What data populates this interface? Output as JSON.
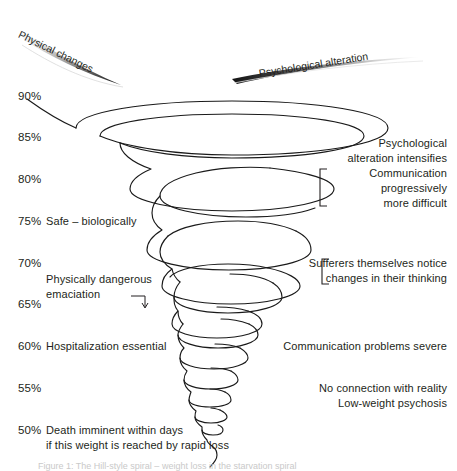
{
  "figure": {
    "wedges": [
      {
        "id": "physical-changes",
        "label": "Physical changes"
      },
      {
        "id": "psychological-alteration",
        "label": "Psychological alteration"
      }
    ],
    "axis": {
      "unit": "%",
      "ticks": [
        "90%",
        "85%",
        "80%",
        "75%",
        "70%",
        "65%",
        "60%",
        "55%",
        "50%"
      ]
    },
    "left_annotations": [
      {
        "tick": "75%",
        "lines": [
          "Safe – biologically"
        ]
      },
      {
        "tick": "70%",
        "lines": [
          "Physically dangerous",
          "emaciation"
        ]
      },
      {
        "tick": "60%",
        "lines": [
          "Hospitalization essential"
        ]
      },
      {
        "tick": "50%",
        "lines": [
          "Death imminent within days",
          "if this weight is reached by rapid loss"
        ]
      }
    ],
    "right_annotations": [
      {
        "id": "psych-intensifies",
        "bracket": false,
        "lines": [
          "Psychological",
          "alteration intensifies"
        ]
      },
      {
        "id": "communication-difficult",
        "bracket": true,
        "lines": [
          "Communication",
          "progressively",
          "more difficult"
        ]
      },
      {
        "id": "sufferers-notice",
        "bracket": true,
        "lines": [
          "Sufferers themselves notice",
          "changes in their thinking"
        ]
      },
      {
        "id": "communication-severe",
        "bracket": false,
        "lines": [
          "Communication problems severe"
        ]
      },
      {
        "id": "psychosis",
        "bracket": false,
        "lines": [
          "No connection with reality",
          "Low-weight psychosis"
        ]
      }
    ],
    "caption": "Figure 1: The Hill-style spiral – weight loss in the starvation spiral",
    "colors": {
      "ink": "#231f20",
      "spiral": "#1a1a1a",
      "wedge_dark": "#1a1a1a",
      "wedge_light": "#ffffff",
      "background": "#ffffff"
    }
  }
}
